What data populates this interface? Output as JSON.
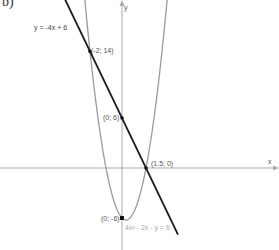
{
  "chart_data": {
    "type": "line",
    "part_label": "b)",
    "title": "",
    "xlabel": "x",
    "ylabel": "y",
    "grid": false,
    "xlim": [
      -7.6,
      9.8
    ],
    "ylim": [
      -9.8,
      20.2
    ],
    "series": [
      {
        "name": "y = -4x + 6",
        "kind": "line",
        "equation": "y = -4x + 6",
        "color": "#1a1a1a",
        "x": [
          -3.5,
          -2,
          0,
          1.5,
          3.4
        ],
        "y": [
          20,
          14,
          6,
          0,
          -7.6
        ]
      },
      {
        "name": "4x² - 2x - y = 6",
        "kind": "parabola",
        "equation": "4x² - 2x - y = 6",
        "color": "#999999",
        "x": [
          -2.3,
          -2,
          -1,
          0,
          0.25,
          1,
          1.5,
          2,
          2.8
        ],
        "y": [
          19.76,
          14,
          0,
          -6,
          -6.25,
          -4,
          0,
          6,
          19.76
        ]
      }
    ],
    "points": [
      {
        "label": "(-2, 14)",
        "x": -2,
        "y": 14
      },
      {
        "label": "(0, 6)",
        "x": 0,
        "y": 6
      },
      {
        "label": "(1.5, 0)",
        "x": 1.5,
        "y": 0
      },
      {
        "label": "(0, -6)",
        "x": 0,
        "y": -6
      }
    ]
  },
  "labels": {
    "part": "b)",
    "line_eq": "y = -4x + 6",
    "parabola_eq": "4x² - 2x - y = 6",
    "x_axis": "x",
    "y_axis": "y",
    "pt1": "(-2; 14)",
    "pt2": "(0; 6)",
    "pt3": "(1.5; 0)",
    "pt4": "(0; -6)"
  }
}
